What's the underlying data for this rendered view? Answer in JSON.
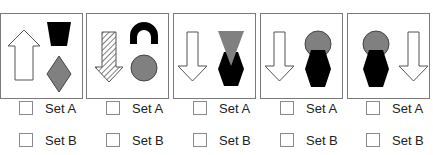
{
  "panels": [
    {
      "id": 1,
      "description": "white upward arrow; black trapezoid above gray diamond",
      "options": [
        {
          "label": "Set A",
          "checked": false
        },
        {
          "label": "Set B",
          "checked": false
        }
      ]
    },
    {
      "id": 2,
      "description": "hatched downward arrow; black arch above gray circle",
      "options": [
        {
          "label": "Set A",
          "checked": false
        },
        {
          "label": "Set B",
          "checked": false
        }
      ]
    },
    {
      "id": 3,
      "description": "white downward arrow; gray inverted triangle over black hexagon",
      "options": [
        {
          "label": "Set A",
          "checked": false
        },
        {
          "label": "Set B",
          "checked": false
        }
      ]
    },
    {
      "id": 4,
      "description": "white downward arrow left; gray circle behind black hexagon right",
      "options": [
        {
          "label": "Set A",
          "checked": false
        },
        {
          "label": "Set B",
          "checked": false
        }
      ]
    },
    {
      "id": 5,
      "description": "gray circle behind black hexagon left; white downward arrow right",
      "options": [
        {
          "label": "Set A",
          "checked": false
        },
        {
          "label": "Set B",
          "checked": false
        }
      ]
    }
  ],
  "colors": {
    "black": "#000000",
    "gray": "#808080",
    "border": "#7a7a7a"
  }
}
